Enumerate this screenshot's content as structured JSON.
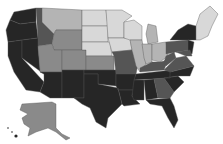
{
  "map": {
    "type": "choropleth",
    "region": "United States",
    "palette": {
      "lightest": "#d8d8d8",
      "light": "#b4b4b4",
      "medium": "#8a8a8a",
      "dark": "#555555",
      "darkest": "#262626"
    },
    "regions": [
      {
        "id": "WA",
        "shade": "darkest"
      },
      {
        "id": "OR",
        "shade": "darkest"
      },
      {
        "id": "CA",
        "shade": "darkest"
      },
      {
        "id": "ID",
        "shade": "dark"
      },
      {
        "id": "NV",
        "shade": "darkest"
      },
      {
        "id": "MT",
        "shade": "light"
      },
      {
        "id": "WY",
        "shade": "medium"
      },
      {
        "id": "UT",
        "shade": "medium"
      },
      {
        "id": "AZ",
        "shade": "darkest"
      },
      {
        "id": "CO",
        "shade": "medium"
      },
      {
        "id": "NM",
        "shade": "darkest"
      },
      {
        "id": "ND",
        "shade": "lightest"
      },
      {
        "id": "SD",
        "shade": "lightest"
      },
      {
        "id": "NE",
        "shade": "lightest"
      },
      {
        "id": "KS",
        "shade": "medium"
      },
      {
        "id": "OK",
        "shade": "darkest"
      },
      {
        "id": "TX",
        "shade": "darkest"
      },
      {
        "id": "MN",
        "shade": "lightest"
      },
      {
        "id": "IA",
        "shade": "lightest"
      },
      {
        "id": "MO",
        "shade": "dark"
      },
      {
        "id": "AR",
        "shade": "darkest"
      },
      {
        "id": "LA",
        "shade": "darkest"
      },
      {
        "id": "WI",
        "shade": "lightest"
      },
      {
        "id": "IL",
        "shade": "light"
      },
      {
        "id": "MI",
        "shade": "light"
      },
      {
        "id": "IN",
        "shade": "light"
      },
      {
        "id": "OH",
        "shade": "light"
      },
      {
        "id": "KY",
        "shade": "dark"
      },
      {
        "id": "TN",
        "shade": "darkest"
      },
      {
        "id": "MS",
        "shade": "darkest"
      },
      {
        "id": "AL",
        "shade": "darkest"
      },
      {
        "id": "GA",
        "shade": "dark"
      },
      {
        "id": "FL",
        "shade": "darkest"
      },
      {
        "id": "SC",
        "shade": "darkest"
      },
      {
        "id": "NC",
        "shade": "darkest"
      },
      {
        "id": "VA",
        "shade": "dark"
      },
      {
        "id": "WV",
        "shade": "dark"
      },
      {
        "id": "PA",
        "shade": "dark"
      },
      {
        "id": "NY",
        "shade": "darkest"
      },
      {
        "id": "NJ",
        "shade": "darkest"
      },
      {
        "id": "New-England",
        "shade": "lightest"
      },
      {
        "id": "AK",
        "shade": "medium"
      },
      {
        "id": "HI",
        "shade": "darkest"
      }
    ]
  }
}
